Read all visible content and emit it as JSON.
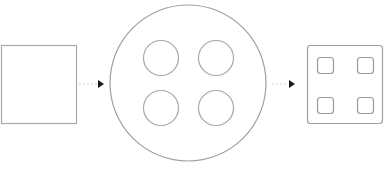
{
  "diagram": {
    "background": "#ffffff",
    "stroke_color": "#9a9a9a",
    "arrow_color": "#1a1a1a",
    "nodes": [
      {
        "id": "empty-square",
        "shape": "square",
        "children": []
      },
      {
        "id": "large-circle",
        "shape": "circle",
        "children": [
          {
            "shape": "circle",
            "position": "top-left"
          },
          {
            "shape": "circle",
            "position": "top-right"
          },
          {
            "shape": "circle",
            "position": "bottom-left"
          },
          {
            "shape": "circle",
            "position": "bottom-right"
          }
        ]
      },
      {
        "id": "rounded-square",
        "shape": "rounded-square",
        "children": [
          {
            "shape": "rounded-square",
            "position": "top-left"
          },
          {
            "shape": "rounded-square",
            "position": "top-right"
          },
          {
            "shape": "rounded-square",
            "position": "bottom-left"
          },
          {
            "shape": "rounded-square",
            "position": "bottom-right"
          }
        ]
      }
    ],
    "edges": [
      {
        "from": "empty-square",
        "to": "large-circle",
        "style": "dotted-arrow"
      },
      {
        "from": "large-circle",
        "to": "rounded-square",
        "style": "dotted-arrow"
      }
    ]
  }
}
